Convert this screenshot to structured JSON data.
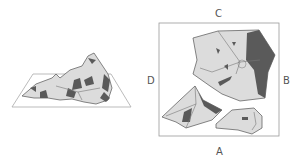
{
  "figure": {
    "type": "diagram",
    "perspective_view": {
      "description": "rock fragment on tilted plane"
    },
    "plan_view": {
      "labels": {
        "top": "C",
        "bottom": "A",
        "left": "D",
        "right": "B"
      }
    }
  },
  "colors": {
    "fill_light": "#dcdcdc",
    "fill_dark": "#5a5a5a",
    "outline": "#777777",
    "frame": "#999999"
  }
}
